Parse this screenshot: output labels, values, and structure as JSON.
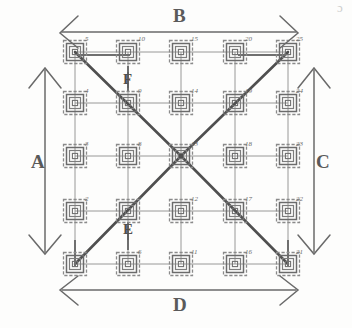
{
  "figure": {
    "background_color": "#fdfdfc",
    "line_color": "#7a7a7a",
    "node_color": "#6e6e6e",
    "label_color": "#5a5a5a",
    "diagonal_color": "#5c5c5c"
  },
  "edge_labels": [
    {
      "id": "A",
      "text": "A",
      "position": "left"
    },
    {
      "id": "B",
      "text": "B",
      "position": "top"
    },
    {
      "id": "C",
      "text": "C",
      "position": "right"
    },
    {
      "id": "D",
      "text": "D",
      "position": "bottom"
    }
  ],
  "interior_labels": [
    {
      "id": "F",
      "text": "F",
      "anchor_node": 9,
      "position": "above"
    },
    {
      "id": "E",
      "text": "E",
      "anchor_node": 7,
      "position": "below"
    }
  ],
  "corner_mark": {
    "text": "ɔ"
  },
  "grid": {
    "rows": 5,
    "cols": 5,
    "numbering": "column-major, bottom-to-top",
    "node_numbers_by_row": [
      [
        5,
        10,
        15,
        20,
        25
      ],
      [
        4,
        9,
        14,
        19,
        24
      ],
      [
        3,
        8,
        13,
        18,
        23
      ],
      [
        2,
        7,
        12,
        17,
        22
      ],
      [
        1,
        6,
        11,
        16,
        21
      ]
    ]
  },
  "nodes": [
    {
      "n": 5,
      "col": 0,
      "row": 0
    },
    {
      "n": 10,
      "col": 1,
      "row": 0
    },
    {
      "n": 15,
      "col": 2,
      "row": 0
    },
    {
      "n": 20,
      "col": 3,
      "row": 0
    },
    {
      "n": 25,
      "col": 4,
      "row": 0
    },
    {
      "n": 4,
      "col": 0,
      "row": 1
    },
    {
      "n": 9,
      "col": 1,
      "row": 1
    },
    {
      "n": 14,
      "col": 2,
      "row": 1
    },
    {
      "n": 19,
      "col": 3,
      "row": 1
    },
    {
      "n": 24,
      "col": 4,
      "row": 1
    },
    {
      "n": 3,
      "col": 0,
      "row": 2
    },
    {
      "n": 8,
      "col": 1,
      "row": 2
    },
    {
      "n": 13,
      "col": 2,
      "row": 2
    },
    {
      "n": 18,
      "col": 3,
      "row": 2
    },
    {
      "n": 23,
      "col": 4,
      "row": 2
    },
    {
      "n": 2,
      "col": 0,
      "row": 3
    },
    {
      "n": 7,
      "col": 1,
      "row": 3
    },
    {
      "n": 12,
      "col": 2,
      "row": 3
    },
    {
      "n": 17,
      "col": 3,
      "row": 3
    },
    {
      "n": 22,
      "col": 4,
      "row": 3
    },
    {
      "n": 1,
      "col": 0,
      "row": 4
    },
    {
      "n": 6,
      "col": 1,
      "row": 4
    },
    {
      "n": 11,
      "col": 2,
      "row": 4
    },
    {
      "n": 16,
      "col": 3,
      "row": 4
    },
    {
      "n": 21,
      "col": 4,
      "row": 4
    }
  ],
  "diagonals": [
    {
      "from": 13,
      "to": 5,
      "note": "center to top-left corner"
    },
    {
      "from": 13,
      "to": 25,
      "note": "center to top-right corner"
    },
    {
      "from": 13,
      "to": 1,
      "note": "center to bottom-left corner"
    },
    {
      "from": 13,
      "to": 21,
      "note": "center to bottom-right corner"
    }
  ]
}
